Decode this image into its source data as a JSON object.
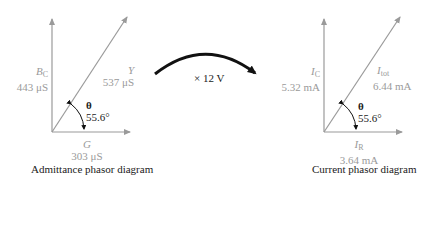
{
  "admittance": {
    "caption": "Admittance phasor diagram",
    "bc": {
      "symbol": "B",
      "sub": "C",
      "value": "443 μS"
    },
    "y": {
      "symbol": "Y",
      "value": "537 μS"
    },
    "g": {
      "symbol": "G",
      "value": "303 μS"
    },
    "theta": {
      "symbol": "θ",
      "value": "55.6°"
    }
  },
  "transform": {
    "label": "× 12 V"
  },
  "current": {
    "caption": "Current phasor diagram",
    "ic": {
      "symbol": "I",
      "sub": "C",
      "value": "5.32 mA"
    },
    "itot": {
      "symbol": "I",
      "sub": "tot",
      "value": "6.44 mA"
    },
    "ir": {
      "symbol": "I",
      "sub": "R",
      "value": "3.64 mA"
    },
    "theta": {
      "symbol": "θ",
      "value": "55.6°"
    }
  },
  "colors": {
    "axis": "#9a9a9a",
    "arrow": "#111111",
    "label": "#9a9a9a"
  }
}
